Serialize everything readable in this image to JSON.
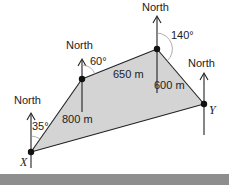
{
  "diagram": {
    "type": "bearing-diagram",
    "north_label": "North",
    "points": {
      "X": {
        "label": "X",
        "x": 31,
        "y": 152
      },
      "A": {
        "x": 82,
        "y": 79
      },
      "B": {
        "x": 157,
        "y": 49
      },
      "Y": {
        "label": "Y",
        "x": 204,
        "y": 104
      }
    },
    "angles": {
      "at_X": "35°",
      "at_A": "60°",
      "at_B": "140°"
    },
    "distances": {
      "XA": "800 m",
      "AB": "650 m",
      "B_vertical": "600 m"
    },
    "colors": {
      "fill": "#d4d4d4",
      "line": "#222222",
      "bar": "#8e8e8e"
    }
  }
}
